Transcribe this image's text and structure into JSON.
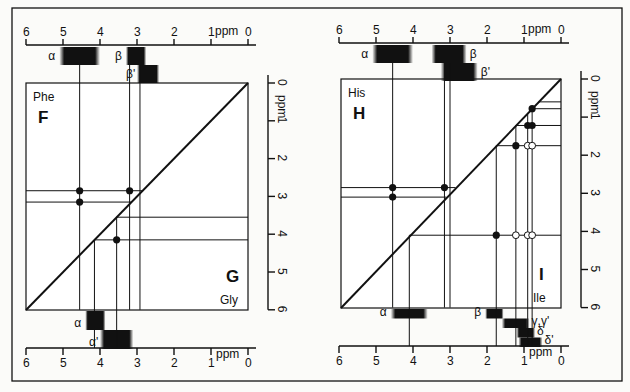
{
  "figure": {
    "frame": {
      "x": 12,
      "y": 8,
      "w": 610,
      "h": 373
    },
    "ink": "#111111",
    "axis_unit": "ppm"
  },
  "panels": [
    {
      "id": "phe-gly",
      "box": {
        "x": 26,
        "y": 83,
        "w": 222,
        "h": 227
      },
      "x_scale": {
        "x0": 248,
        "px_per_ppm": 37
      },
      "y_scale": {
        "y0": 83,
        "px_per_ppm": 37.8
      },
      "top_axis": {
        "y": 45,
        "ticks": [
          "6",
          "5",
          "4",
          "3",
          "2",
          "1",
          "0"
        ],
        "unit_label": "ppm"
      },
      "bottom_axis": {
        "y": 348,
        "ticks": [
          "6",
          "5",
          "4",
          "3",
          "2",
          "1",
          "0"
        ],
        "unit_label": "ppm"
      },
      "right_axis": {
        "x": 268,
        "ticks": [
          "0",
          "1",
          "2",
          "3",
          "4",
          "5",
          "6"
        ],
        "unit_label": "ppm"
      },
      "upper_residue": {
        "name": "Phe",
        "code": "F"
      },
      "lower_residue": {
        "name": "Gly",
        "code": "G"
      },
      "upper_peaks": [
        {
          "label": "α",
          "from": 5.1,
          "to": 4.0,
          "row": 0
        },
        {
          "label": "β",
          "from": 3.3,
          "to": 2.75,
          "row": 0
        },
        {
          "label": "β'",
          "from": 3.0,
          "to": 2.4,
          "row": 1
        }
      ],
      "lower_peaks": [
        {
          "label": "α",
          "from": 4.4,
          "to": 3.85,
          "row": 0
        },
        {
          "label": "α'",
          "from": 4.0,
          "to": 3.1,
          "row": 1
        }
      ],
      "upper_lines": {
        "v": [
          4.55,
          3.2,
          2.92
        ],
        "h": [
          2.85,
          3.15
        ]
      },
      "upper_dots": [
        [
          4.55,
          2.85
        ],
        [
          3.2,
          2.85
        ],
        [
          4.55,
          3.15
        ]
      ],
      "lower_lines": {
        "v": [
          4.15,
          3.55
        ],
        "h": [
          3.55,
          4.15
        ]
      },
      "lower_dots": [
        [
          3.55,
          4.15
        ]
      ]
    },
    {
      "id": "his-ile",
      "box": {
        "x": 341,
        "y": 79,
        "w": 220,
        "h": 229
      },
      "x_scale": {
        "x0": 561,
        "px_per_ppm": 37
      },
      "y_scale": {
        "y0": 79,
        "px_per_ppm": 38.1
      },
      "top_axis": {
        "y": 43,
        "ticks": [
          "6",
          "5",
          "4",
          "3",
          "2",
          "1",
          "0"
        ],
        "unit_label": "ppm"
      },
      "bottom_axis": {
        "y": 346,
        "ticks": [
          "6",
          "5",
          "4",
          "3",
          "2",
          "1",
          "0"
        ],
        "unit_label": "ppm"
      },
      "right_axis": {
        "x": 581,
        "ticks": [
          "0",
          "1",
          "2",
          "3",
          "4",
          "5",
          "6"
        ],
        "unit_label": "ppm"
      },
      "upper_residue": {
        "name": "His",
        "code": "H"
      },
      "lower_residue": {
        "name": "Ile",
        "code": "I"
      },
      "upper_peaks": [
        {
          "label": "α",
          "from": 5.1,
          "to": 4.0,
          "row": 0
        },
        {
          "label": "β",
          "from": 3.5,
          "to": 2.55,
          "row": 0,
          "label_right": true
        },
        {
          "label": "β'",
          "from": 3.25,
          "to": 2.25,
          "row": 1,
          "label_right": true
        }
      ],
      "lower_peaks": [
        {
          "label": "α",
          "from": 4.6,
          "to": 3.6,
          "row": 0
        },
        {
          "label": "β",
          "from": 2.05,
          "to": 1.55,
          "row": 0
        },
        {
          "label": "γ,γ'",
          "from": 1.6,
          "to": 0.85,
          "row": 1,
          "label_right": true
        },
        {
          "label": "δ",
          "from": 1.2,
          "to": 0.7,
          "row": 2,
          "label_right": true
        },
        {
          "label": "δ'",
          "from": 1.15,
          "to": 0.5,
          "row": 3,
          "label_right": true
        }
      ],
      "upper_lines": {
        "v": [
          4.55,
          3.15,
          3.0
        ],
        "h": [
          2.85,
          3.1
        ]
      },
      "upper_dots": [
        [
          4.55,
          2.85
        ],
        [
          3.15,
          2.85
        ],
        [
          4.55,
          3.1
        ]
      ],
      "lower_lines": {
        "v": [
          4.1,
          1.75,
          1.22,
          0.9,
          0.78
        ],
        "h": [
          0.6,
          0.78,
          1.22,
          1.75,
          4.1
        ]
      },
      "lower_dots_filled": [
        [
          0.78,
          0.78
        ],
        [
          0.9,
          1.22
        ],
        [
          0.78,
          1.22
        ],
        [
          1.22,
          1.75
        ],
        [
          1.75,
          4.1
        ]
      ],
      "lower_dots_open": [
        [
          0.9,
          1.75
        ],
        [
          0.78,
          1.75
        ],
        [
          1.22,
          4.1
        ],
        [
          0.9,
          4.1
        ],
        [
          0.78,
          4.1
        ]
      ]
    }
  ]
}
